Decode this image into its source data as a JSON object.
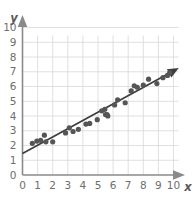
{
  "chart_data": {
    "type": "scatter",
    "title": "",
    "subtitle": "",
    "xlabel": "x",
    "ylabel": "y",
    "xlim": [
      0,
      10
    ],
    "ylim": [
      0,
      10
    ],
    "xticks": [
      0,
      1,
      2,
      3,
      4,
      5,
      6,
      7,
      8,
      9,
      10
    ],
    "yticks": [
      0,
      1,
      2,
      3,
      4,
      5,
      6,
      7,
      8,
      9,
      10
    ],
    "xtick_labels": [
      "0",
      "1",
      "2",
      "3",
      "4",
      "5",
      "6",
      "7",
      "8",
      "9",
      "10"
    ],
    "ytick_labels": [
      "0",
      "1",
      "2",
      "3",
      "4",
      "5",
      "6",
      "7",
      "8",
      "9",
      "10"
    ],
    "grid": true,
    "legend": null,
    "point_color": "#555555",
    "grid_color": "#d8d8d8",
    "axis_color": "#8a8a8a",
    "trend_color": "#3d3d3d",
    "points": [
      {
        "x": 0.65,
        "y": 2.15
      },
      {
        "x": 0.95,
        "y": 2.3
      },
      {
        "x": 1.2,
        "y": 2.35
      },
      {
        "x": 1.45,
        "y": 2.7
      },
      {
        "x": 1.55,
        "y": 2.25
      },
      {
        "x": 2.0,
        "y": 2.25
      },
      {
        "x": 2.85,
        "y": 2.85
      },
      {
        "x": 3.1,
        "y": 3.2
      },
      {
        "x": 3.35,
        "y": 2.95
      },
      {
        "x": 3.7,
        "y": 3.1
      },
      {
        "x": 4.2,
        "y": 3.45
      },
      {
        "x": 4.45,
        "y": 3.5
      },
      {
        "x": 4.95,
        "y": 3.75
      },
      {
        "x": 5.25,
        "y": 4.35
      },
      {
        "x": 5.45,
        "y": 4.45
      },
      {
        "x": 5.5,
        "y": 4.1
      },
      {
        "x": 5.6,
        "y": 4.1
      },
      {
        "x": 5.65,
        "y": 4.0
      },
      {
        "x": 6.1,
        "y": 4.75
      },
      {
        "x": 6.3,
        "y": 5.1
      },
      {
        "x": 6.8,
        "y": 4.9
      },
      {
        "x": 7.2,
        "y": 5.7
      },
      {
        "x": 7.4,
        "y": 6.05
      },
      {
        "x": 7.6,
        "y": 5.95
      },
      {
        "x": 8.0,
        "y": 6.1
      },
      {
        "x": 8.35,
        "y": 6.5
      },
      {
        "x": 8.9,
        "y": 6.2
      },
      {
        "x": 9.3,
        "y": 6.6
      },
      {
        "x": 9.6,
        "y": 6.75
      },
      {
        "x": 9.75,
        "y": 6.95
      }
    ],
    "trend_line": {
      "x_start": 0.0,
      "y_start": 1.45,
      "x_end": 10.35,
      "y_end": 7.25,
      "has_arrowhead": true,
      "slope": 0.56,
      "intercept": 1.45
    }
  }
}
